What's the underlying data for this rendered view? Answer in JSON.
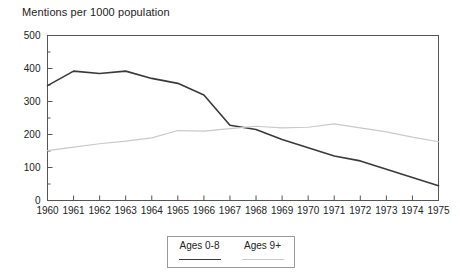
{
  "chart_data": {
    "type": "line",
    "title": "Mentions per 1000 population",
    "xlabel": "",
    "ylabel": "",
    "x": [
      1960,
      1961,
      1962,
      1963,
      1964,
      1965,
      1966,
      1967,
      1968,
      1969,
      1970,
      1971,
      1972,
      1973,
      1974,
      1975
    ],
    "categories": [
      "1960",
      "1961",
      "1962",
      "1963",
      "1964",
      "1965",
      "1966",
      "1967",
      "1968",
      "1969",
      "1970",
      "1971",
      "1972",
      "1973",
      "1974",
      "1975"
    ],
    "series": [
      {
        "name": "Ages 0-8",
        "color": "#3a3a3a",
        "values": [
          348,
          392,
          385,
          392,
          370,
          355,
          320,
          228,
          215,
          185,
          160,
          135,
          120,
          95,
          70,
          45
        ]
      },
      {
        "name": "Ages 9+",
        "color": "#c9c9c9",
        "values": [
          151,
          162,
          172,
          180,
          190,
          212,
          210,
          218,
          225,
          220,
          222,
          232,
          220,
          208,
          192,
          178
        ]
      }
    ],
    "xlim": [
      1960,
      1975
    ],
    "ylim": [
      0,
      500
    ],
    "ytick_labels": [
      "0",
      "100",
      "200",
      "300",
      "400",
      "500"
    ],
    "ytick_values": [
      0,
      100,
      200,
      300,
      400,
      500
    ],
    "yminor_step": 50,
    "grid": false,
    "legend_position": "bottom-center",
    "legend_entries": [
      "Ages 0-8",
      "Ages 9+"
    ]
  },
  "legend": {
    "entry_0_label": "Ages 0-8",
    "entry_1_label": "Ages 9+"
  },
  "axis": {
    "frame_color": "#555555"
  }
}
